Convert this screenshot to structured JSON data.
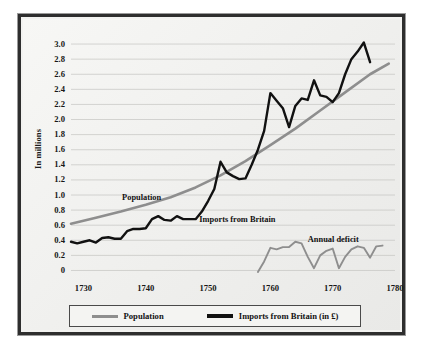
{
  "chart_data": {
    "type": "line",
    "title": "",
    "xlabel": "",
    "ylabel": "In millions",
    "xlim": [
      1728,
      1780
    ],
    "ylim": [
      -0.06,
      3.12
    ],
    "grid": true,
    "legend_position": "bottom",
    "y_ticks": [
      "3.0",
      "2.8",
      "2.6",
      "2.4",
      "2.2",
      "2.0",
      "1.8",
      "1.6",
      "1.4",
      "1.2",
      "1.0",
      "0.8",
      "0.6",
      "0.4",
      "0.2",
      "0"
    ],
    "y_tick_values": [
      3.0,
      2.8,
      2.6,
      2.4,
      2.2,
      2.0,
      1.8,
      1.6,
      1.4,
      1.2,
      1.0,
      0.8,
      0.6,
      0.4,
      0.2,
      0
    ],
    "x_ticks": [
      "1730",
      "1740",
      "1750",
      "1760",
      "1770",
      "1780"
    ],
    "x_tick_values": [
      1730,
      1740,
      1750,
      1760,
      1770,
      1780
    ],
    "annotations": [
      {
        "text": "Population",
        "x": 1736.2,
        "y": 0.95
      },
      {
        "text": "Imports from Britain",
        "x": 1748.6,
        "y": 0.66
      },
      {
        "text": "Annual deficit",
        "x": 1766.0,
        "y": 0.4
      }
    ],
    "series": [
      {
        "name": "Population",
        "color": "#8e8e8e",
        "x": [
          1728,
          1732,
          1736,
          1740,
          1744,
          1748,
          1752,
          1756,
          1760,
          1764,
          1768,
          1772,
          1776,
          1779
        ],
        "values": [
          0.62,
          0.7,
          0.78,
          0.87,
          0.97,
          1.1,
          1.26,
          1.45,
          1.66,
          1.88,
          2.12,
          2.36,
          2.6,
          2.74
        ]
      },
      {
        "name": "Imports from Britain (in £)",
        "color": "#111111",
        "x": [
          1728,
          1729,
          1730,
          1731,
          1732,
          1733,
          1734,
          1735,
          1736,
          1737,
          1738,
          1739,
          1740,
          1741,
          1742,
          1743,
          1744,
          1745,
          1746,
          1747,
          1748,
          1749,
          1750,
          1751,
          1752,
          1753,
          1754,
          1755,
          1756,
          1757,
          1758,
          1759,
          1760,
          1761,
          1762,
          1763,
          1764,
          1765,
          1766,
          1767,
          1768,
          1769,
          1770,
          1771,
          1772,
          1773,
          1774,
          1775,
          1776
        ],
        "values": [
          0.38,
          0.36,
          0.38,
          0.4,
          0.37,
          0.43,
          0.44,
          0.42,
          0.42,
          0.52,
          0.55,
          0.55,
          0.56,
          0.68,
          0.72,
          0.67,
          0.66,
          0.72,
          0.68,
          0.68,
          0.68,
          0.78,
          0.92,
          1.08,
          1.44,
          1.3,
          1.25,
          1.21,
          1.22,
          1.4,
          1.6,
          1.85,
          2.35,
          2.25,
          2.15,
          1.9,
          2.18,
          2.28,
          2.26,
          2.52,
          2.32,
          2.3,
          2.23,
          2.35,
          2.6,
          2.8,
          2.9,
          3.02,
          2.76
        ]
      },
      {
        "name": "Annual deficit",
        "color": "#8e8e8e",
        "x": [
          1758,
          1759,
          1760,
          1761,
          1762,
          1763,
          1764,
          1765,
          1766,
          1767,
          1768,
          1769,
          1770,
          1771,
          1772,
          1773,
          1774,
          1775,
          1776,
          1777,
          1778
        ],
        "values": [
          -0.02,
          0.12,
          0.3,
          0.28,
          0.31,
          0.31,
          0.38,
          0.36,
          0.18,
          0.03,
          0.2,
          0.26,
          0.29,
          0.03,
          0.18,
          0.28,
          0.32,
          0.3,
          0.17,
          0.32,
          0.33
        ]
      }
    ]
  },
  "legend": {
    "items": [
      {
        "label": "Population",
        "color": "#8e8e8e"
      },
      {
        "label": "Imports from Britain (in £)",
        "color": "#111111"
      }
    ]
  }
}
